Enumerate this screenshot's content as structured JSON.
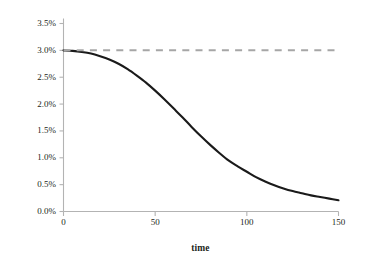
{
  "chart_data": {
    "type": "line",
    "title": "",
    "subtitle": "",
    "xlabel": "time",
    "ylabel": "growth rate",
    "xlim": [
      0,
      150
    ],
    "ylim": [
      0,
      0.035
    ],
    "grid": false,
    "legend": "none",
    "xticks": [
      0,
      50,
      100,
      150
    ],
    "xtick_labels": [
      "0",
      "50",
      "100",
      "150"
    ],
    "yticks": [
      0.0,
      0.005,
      0.01,
      0.015,
      0.02,
      0.025,
      0.03,
      0.035
    ],
    "ytick_labels": [
      "0.0%",
      "0.5%",
      "1.0%",
      "1.5%",
      "2.0%",
      "2.5%",
      "3.0%",
      "3.5%"
    ],
    "series": [
      {
        "name": "growth rate",
        "style": "solid",
        "color": "#1a1a1a",
        "width": 2.1,
        "x": [
          0,
          5,
          10,
          15,
          20,
          25,
          30,
          35,
          40,
          45,
          50,
          55,
          60,
          65,
          70,
          75,
          80,
          85,
          90,
          95,
          100,
          105,
          110,
          115,
          120,
          125,
          130,
          135,
          140,
          145,
          150
        ],
        "y": [
          0.03,
          0.0299,
          0.0297,
          0.0294,
          0.0289,
          0.0283,
          0.0275,
          0.0265,
          0.0253,
          0.024,
          0.0225,
          0.0209,
          0.0192,
          0.0175,
          0.0157,
          0.014,
          0.0124,
          0.0109,
          0.0095,
          0.0084,
          0.0074,
          0.0064,
          0.0056,
          0.0049,
          0.0043,
          0.0038,
          0.0034,
          0.003,
          0.0027,
          0.0024,
          0.0021
        ]
      },
      {
        "name": "reference level",
        "style": "dashed",
        "color": "#a6a6a6",
        "width": 2.0,
        "x": [
          0,
          150
        ],
        "y": [
          0.03,
          0.03
        ]
      }
    ],
    "annotations": []
  },
  "axes": {
    "spine_color": "#b3b3b3",
    "tick_color": "#b3b3b3"
  }
}
